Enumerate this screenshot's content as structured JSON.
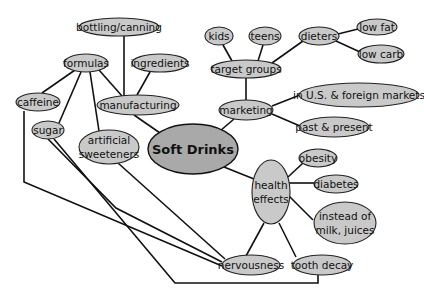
{
  "diagram": {
    "type": "concept-map",
    "title": "Soft Drinks",
    "nodes": {
      "center": {
        "label": "Soft Drinks"
      },
      "manufacturing": {
        "label": "manufacturing"
      },
      "bottling": {
        "label": "bottling/canning"
      },
      "formulas": {
        "label": "formulas"
      },
      "ingredients": {
        "label": "ingredients"
      },
      "caffeine": {
        "label": "caffeine"
      },
      "sugar": {
        "label": "sugar"
      },
      "artificial": {
        "line1": "artificial",
        "line2": "sweeteners"
      },
      "marketing": {
        "label": "marketing"
      },
      "target_groups": {
        "label": "target groups"
      },
      "kids": {
        "label": "kids"
      },
      "teens": {
        "label": "teens"
      },
      "dieters": {
        "label": "dieters"
      },
      "low_fat": {
        "label": "low fat"
      },
      "low_carb": {
        "label": "low carb"
      },
      "markets": {
        "label": "in U.S. & foreign markets"
      },
      "past_present": {
        "label": "past & present"
      },
      "health": {
        "line1": "health",
        "line2": "effects"
      },
      "obesity": {
        "label": "obesity"
      },
      "diabetes": {
        "label": "diabetes"
      },
      "instead": {
        "line1": "instead of",
        "line2": "milk, juices"
      },
      "nervousness": {
        "label": "nervousness"
      },
      "tooth_decay": {
        "label": "tooth decay"
      }
    },
    "edges": [
      [
        "Soft Drinks",
        "manufacturing"
      ],
      [
        "Soft Drinks",
        "marketing"
      ],
      [
        "Soft Drinks",
        "health effects"
      ],
      [
        "manufacturing",
        "bottling/canning"
      ],
      [
        "manufacturing",
        "formulas"
      ],
      [
        "manufacturing",
        "ingredients"
      ],
      [
        "formulas",
        "caffeine"
      ],
      [
        "formulas",
        "sugar"
      ],
      [
        "formulas",
        "artificial sweeteners"
      ],
      [
        "marketing",
        "target groups"
      ],
      [
        "marketing",
        "in U.S. & foreign markets"
      ],
      [
        "marketing",
        "past & present"
      ],
      [
        "target groups",
        "kids"
      ],
      [
        "target groups",
        "teens"
      ],
      [
        "target groups",
        "dieters"
      ],
      [
        "dieters",
        "low fat"
      ],
      [
        "dieters",
        "low carb"
      ],
      [
        "health effects",
        "obesity"
      ],
      [
        "health effects",
        "diabetes"
      ],
      [
        "health effects",
        "instead of milk, juices"
      ],
      [
        "health effects",
        "nervousness"
      ],
      [
        "health effects",
        "tooth decay"
      ],
      [
        "caffeine",
        "nervousness"
      ],
      [
        "sugar",
        "nervousness"
      ],
      [
        "sugar",
        "tooth decay"
      ],
      [
        "artificial sweeteners",
        "nervousness"
      ]
    ]
  }
}
